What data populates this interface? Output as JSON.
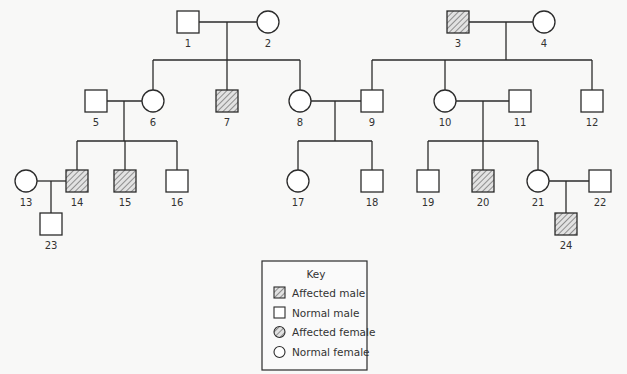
{
  "diagram": {
    "type": "pedigree",
    "colors": {
      "line": "#2b2b2b",
      "background": "#f8f8f7",
      "hatch": "#555555",
      "label": "#333333"
    },
    "individuals": [
      {
        "id": "1",
        "sex": "male",
        "affected": false,
        "gen": 1
      },
      {
        "id": "2",
        "sex": "female",
        "affected": false,
        "gen": 1
      },
      {
        "id": "3",
        "sex": "male",
        "affected": true,
        "gen": 1
      },
      {
        "id": "4",
        "sex": "female",
        "affected": false,
        "gen": 1
      },
      {
        "id": "5",
        "sex": "male",
        "affected": false,
        "gen": 2
      },
      {
        "id": "6",
        "sex": "female",
        "affected": false,
        "gen": 2
      },
      {
        "id": "7",
        "sex": "male",
        "affected": true,
        "gen": 2
      },
      {
        "id": "8",
        "sex": "female",
        "affected": false,
        "gen": 2
      },
      {
        "id": "9",
        "sex": "male",
        "affected": false,
        "gen": 2
      },
      {
        "id": "10",
        "sex": "female",
        "affected": false,
        "gen": 2
      },
      {
        "id": "11",
        "sex": "male",
        "affected": false,
        "gen": 2
      },
      {
        "id": "12",
        "sex": "male",
        "affected": false,
        "gen": 2
      },
      {
        "id": "13",
        "sex": "female",
        "affected": false,
        "gen": 3
      },
      {
        "id": "14",
        "sex": "male",
        "affected": true,
        "gen": 3
      },
      {
        "id": "15",
        "sex": "male",
        "affected": true,
        "gen": 3
      },
      {
        "id": "16",
        "sex": "male",
        "affected": false,
        "gen": 3
      },
      {
        "id": "17",
        "sex": "female",
        "affected": false,
        "gen": 3
      },
      {
        "id": "18",
        "sex": "male",
        "affected": false,
        "gen": 3
      },
      {
        "id": "19",
        "sex": "male",
        "affected": false,
        "gen": 3
      },
      {
        "id": "20",
        "sex": "male",
        "affected": true,
        "gen": 3
      },
      {
        "id": "21",
        "sex": "female",
        "affected": false,
        "gen": 3
      },
      {
        "id": "22",
        "sex": "male",
        "affected": false,
        "gen": 3
      },
      {
        "id": "23",
        "sex": "male",
        "affected": false,
        "gen": 4
      },
      {
        "id": "24",
        "sex": "male",
        "affected": true,
        "gen": 4
      }
    ],
    "matings": [
      {
        "partners": [
          "1",
          "2"
        ],
        "children": [
          "6",
          "7",
          "8"
        ]
      },
      {
        "partners": [
          "3",
          "4"
        ],
        "children": [
          "9",
          "10",
          "12"
        ]
      },
      {
        "partners": [
          "5",
          "6"
        ],
        "children": [
          "14",
          "15",
          "16"
        ]
      },
      {
        "partners": [
          "8",
          "9"
        ],
        "children": [
          "17",
          "18"
        ]
      },
      {
        "partners": [
          "10",
          "11"
        ],
        "children": [
          "19",
          "20",
          "21"
        ]
      },
      {
        "partners": [
          "13",
          "14"
        ],
        "children": [
          "23"
        ]
      },
      {
        "partners": [
          "21",
          "22"
        ],
        "children": [
          "24"
        ]
      }
    ],
    "labels": {
      "l1": "1",
      "l2": "2",
      "l3": "3",
      "l4": "4",
      "l5": "5",
      "l6": "6",
      "l7": "7",
      "l8": "8",
      "l9": "9",
      "l10": "10",
      "l11": "11",
      "l12": "12",
      "l13": "13",
      "l14": "14",
      "l15": "15",
      "l16": "16",
      "l17": "17",
      "l18": "18",
      "l19": "19",
      "l20": "20",
      "l21": "21",
      "l22": "22",
      "l23": "23",
      "l24": "24"
    }
  },
  "key": {
    "title": "Key",
    "items": [
      {
        "symbol": "hatched-square",
        "label": "Affected male"
      },
      {
        "symbol": "square",
        "label": "Normal male"
      },
      {
        "symbol": "hatched-circle",
        "label": "Affected female"
      },
      {
        "symbol": "circle",
        "label": "Normal female"
      }
    ]
  }
}
